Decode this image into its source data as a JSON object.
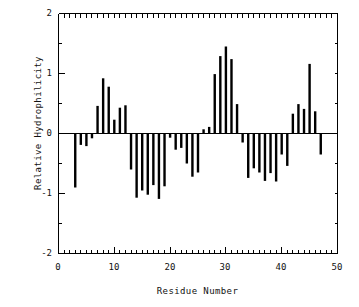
{
  "chart_data": {
    "type": "bar",
    "title": "",
    "xlabel": "Residue Number",
    "ylabel": "Relative Hydrophilicity",
    "xlim": [
      0,
      50
    ],
    "ylim": [
      -2,
      2
    ],
    "xticks": [
      0,
      10,
      20,
      30,
      40,
      50
    ],
    "yticks": [
      -2,
      -1,
      0,
      1,
      2
    ],
    "xminor_step": 1,
    "yminor_step": 0.5,
    "grid": false,
    "legend": null,
    "bar_color": "#000000",
    "axis_color": "#000000",
    "x": [
      3,
      4,
      5,
      6,
      7,
      8,
      9,
      10,
      11,
      12,
      13,
      14,
      15,
      16,
      17,
      18,
      19,
      20,
      21,
      22,
      23,
      24,
      25,
      26,
      27,
      28,
      29,
      30,
      31,
      32,
      33,
      34,
      35,
      36,
      37,
      38,
      39,
      40,
      41,
      42,
      43,
      44,
      45,
      46,
      47
    ],
    "values": [
      -0.9,
      -0.19,
      -0.21,
      -0.08,
      0.46,
      0.92,
      0.78,
      0.23,
      0.43,
      0.47,
      -0.6,
      -1.07,
      -0.95,
      -1.02,
      -0.86,
      -1.09,
      -0.88,
      -0.07,
      -0.27,
      -0.24,
      -0.5,
      -0.72,
      -0.65,
      0.07,
      0.11,
      0.99,
      1.29,
      1.45,
      1.24,
      0.49,
      -0.15,
      -0.74,
      -0.58,
      -0.65,
      -0.79,
      -0.66,
      -0.8,
      -0.35,
      -0.54,
      0.33,
      0.49,
      0.41,
      1.16,
      0.37,
      -0.35
    ]
  },
  "axes": {
    "ylabel_text": "Relative Hydrophilicity",
    "xlabel_text": "Residue Number",
    "ytick_labels": [
      "2",
      "1",
      "0",
      "-1",
      "-2"
    ],
    "xtick_labels": [
      "0",
      "10",
      "20",
      "30",
      "40",
      "50"
    ]
  }
}
